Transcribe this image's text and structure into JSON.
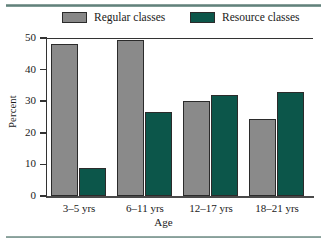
{
  "chart_data": {
    "type": "bar",
    "title": "",
    "xlabel": "Age",
    "ylabel": "Percent",
    "ylim": [
      0,
      50
    ],
    "yticks": [
      "0",
      "10",
      "20",
      "30",
      "40",
      "50"
    ],
    "grid": false,
    "legend_position": "top",
    "categories": [
      "3–5 yrs",
      "6–11 yrs",
      "12–17 yrs",
      "18–21 yrs"
    ],
    "series": [
      {
        "name": "Regular classes",
        "color": "#8a8a8a",
        "values": [
          48,
          49.5,
          30,
          24.5
        ]
      },
      {
        "name": "Resource classes",
        "color": "#0c564a",
        "values": [
          9,
          26.5,
          32,
          33
        ]
      }
    ]
  },
  "legend": {
    "entries": [
      {
        "label": "Regular classes",
        "swatch": "gray-swatch"
      },
      {
        "label": "Resource classes",
        "swatch": "teal-swatch"
      }
    ]
  }
}
